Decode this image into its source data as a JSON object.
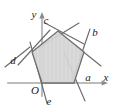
{
  "figure": {
    "background_color": "#ffffff",
    "axis_color": "#b8b8b8",
    "line_color": "#5a5a5a",
    "polygon_fill": "#d9d9d9",
    "polygon_stroke": "#6e6e6e",
    "label_color": "#1c1c1c"
  },
  "axes": {
    "x_label": "x",
    "y_label": "y",
    "origin_label": "O",
    "x_axis_y": 83,
    "y_axis_x": 42,
    "x_axis_start": 8,
    "x_axis_end": 108,
    "y_axis_start": 96,
    "y_axis_end": 14
  },
  "line_labels": [
    {
      "id": "a",
      "text": "a",
      "x": 88,
      "y": 80
    },
    {
      "id": "b",
      "text": "b",
      "x": 93,
      "y": 36
    },
    {
      "id": "c",
      "text": "c",
      "x": 48,
      "y": 26
    },
    {
      "id": "d",
      "text": "d",
      "x": 14,
      "y": 60
    },
    {
      "id": "e",
      "text": "e",
      "x": 48,
      "y": 103
    }
  ],
  "polygon": {
    "name": "shaded-pentagon",
    "points": "58,31 84,52 74,83 42,83 32,52",
    "vertices": [
      {
        "name": "top",
        "x": 58,
        "y": 31
      },
      {
        "name": "right",
        "x": 84,
        "y": 52
      },
      {
        "name": "bottom-right",
        "x": 74,
        "y": 83
      },
      {
        "name": "bottom-left",
        "x": 42,
        "y": 83
      },
      {
        "name": "left",
        "x": 32,
        "y": 52
      }
    ]
  },
  "extended_lines": [
    {
      "id": "line-a",
      "label": "a",
      "x1": 74,
      "y1": 83,
      "x2": 35,
      "y2": 83,
      "note": "bottom side along x-axis"
    },
    {
      "id": "line-b",
      "label": "b",
      "x1": 89,
      "y1": 31,
      "x2": 75,
      "y2": 74,
      "note": "through right vertex"
    },
    {
      "id": "line-c",
      "label": "c",
      "x1": 45,
      "y1": 24,
      "x2": 80,
      "y2": 42,
      "note": "upper-left to right through top vertex"
    },
    {
      "id": "line-c2",
      "label": "c",
      "x1": 76,
      "y1": 24,
      "x2": 40,
      "y2": 46,
      "note": "upper-right to left through top vertex"
    },
    {
      "id": "line-d",
      "label": "d",
      "x1": 21,
      "y1": 62,
      "x2": 47,
      "y2": 32,
      "note": "through left vertex"
    },
    {
      "id": "line-e",
      "label": "e",
      "x1": 46,
      "y1": 102,
      "x2": 31,
      "y2": 44,
      "note": "through bottom-left vertex"
    },
    {
      "id": "line-f",
      "label": "",
      "x1": 84,
      "y1": 99,
      "x2": 66,
      "y2": 56,
      "note": "through bottom-right vertex"
    },
    {
      "id": "line-g",
      "label": "",
      "x1": 6,
      "y1": 65,
      "x2": 24,
      "y2": 43,
      "note": "left extension segment"
    },
    {
      "id": "line-h",
      "label": "",
      "x1": 99,
      "y1": 67,
      "x2": 79,
      "y2": 44,
      "note": "right extension segment"
    }
  ]
}
